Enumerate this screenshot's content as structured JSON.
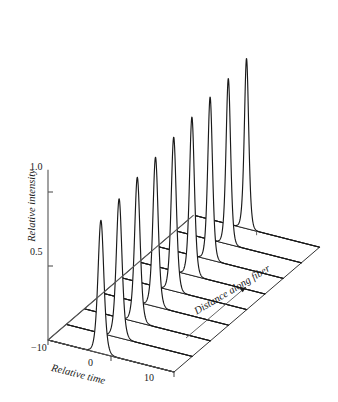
{
  "figure": {
    "background": "#ffffff",
    "line_color": "#1a1a1a",
    "axis_color": "#555555"
  },
  "axes": {
    "y": {
      "name": "Relative intensity",
      "ticks": [
        "0.5",
        "1.0"
      ],
      "tick_values": [
        0.5,
        1.0
      ],
      "range": [
        0,
        1.15
      ]
    },
    "x": {
      "name": "Relative time",
      "ticks": [
        "−10",
        "0",
        "10"
      ],
      "tick_values": [
        -10,
        0,
        10
      ],
      "range": [
        -10,
        10
      ]
    },
    "z": {
      "name": "Distance along fiber",
      "arrow": "arrow-up-right",
      "ticks": []
    }
  },
  "chart_data": {
    "type": "line",
    "title": "",
    "subtitle": "",
    "xlabel": "Relative time",
    "ylabel": "Relative intensity",
    "zlabel": "Distance along fiber",
    "projection": "3d-waterfall",
    "grid": false,
    "legend": null,
    "xlim": [
      -10,
      10
    ],
    "ylim": [
      0,
      1.15
    ],
    "x": [
      -10,
      -9,
      -8,
      -7,
      -6,
      -5,
      -4,
      -3,
      -2,
      -1,
      0,
      1,
      2,
      3,
      4,
      5,
      6,
      7,
      8,
      9,
      10
    ],
    "series": [
      {
        "name": "trace 1",
        "z": 0,
        "peak_center": -1.6,
        "peak_width": 0.62,
        "peak_amplitude": 0.9
      },
      {
        "name": "trace 2",
        "z": 1,
        "peak_center": -1.6,
        "peak_width": 0.6,
        "peak_amplitude": 0.94
      },
      {
        "name": "trace 3",
        "z": 2,
        "peak_center": -1.6,
        "peak_width": 0.58,
        "peak_amplitude": 0.98
      },
      {
        "name": "trace 4",
        "z": 3,
        "peak_center": -1.6,
        "peak_width": 0.56,
        "peak_amplitude": 1.01
      },
      {
        "name": "trace 5",
        "z": 4,
        "peak_center": -1.6,
        "peak_width": 0.54,
        "peak_amplitude": 1.04
      },
      {
        "name": "trace 6",
        "z": 5,
        "peak_center": -1.6,
        "peak_width": 0.52,
        "peak_amplitude": 1.07
      },
      {
        "name": "trace 7",
        "z": 6,
        "peak_center": -1.6,
        "peak_width": 0.5,
        "peak_amplitude": 1.1
      },
      {
        "name": "trace 8",
        "z": 7,
        "peak_center": -1.6,
        "peak_width": 0.48,
        "peak_amplitude": 1.12
      },
      {
        "name": "trace 9",
        "z": 8,
        "peak_center": -1.6,
        "peak_width": 0.46,
        "peak_amplitude": 1.15
      }
    ],
    "n_series": 9,
    "annotations": []
  }
}
